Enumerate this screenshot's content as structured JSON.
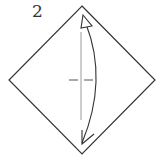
{
  "diagram": {
    "type": "origami-step",
    "step_number": "2",
    "paper": {
      "shape": "square-rotated-45",
      "vertices": {
        "top": [
          82,
          6
        ],
        "right": [
          155,
          80
        ],
        "bottom": [
          82,
          154
        ],
        "left": [
          9,
          80
        ]
      },
      "stroke": "#333333",
      "fill": "#ffffff"
    },
    "fold_line": {
      "kind": "valley-fold",
      "orientation": "vertical",
      "x": 81,
      "y_start": 32,
      "y_end": 120,
      "color": "#999999",
      "cross_marks": {
        "y": 80,
        "segments": [
          [
            69,
            78
          ],
          [
            84,
            93
          ]
        ],
        "color": "#555555"
      }
    },
    "arrow": {
      "kind": "fold-and-unfold",
      "direction": "bottom-to-top-and-back",
      "start": [
        82,
        143
      ],
      "end": [
        84,
        20
      ],
      "bulge_x": 96,
      "color": "#333333",
      "head_top": "hollow-triangle",
      "head_bottom": "open-v"
    }
  }
}
